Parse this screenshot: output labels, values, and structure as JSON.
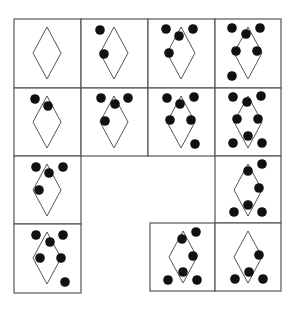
{
  "puzzle": {
    "title": "",
    "stroke_color": "#555555",
    "dot_color": "#111111",
    "dot_radius": 4.8,
    "diamond": {
      "cx": 33,
      "cy": 34,
      "half_width": 14,
      "half_height": 26
    },
    "cells": [
      {
        "id": "r0c0",
        "row": 0,
        "col": 0,
        "x": 14,
        "y": 19,
        "w": 67,
        "h": 69,
        "dots": []
      },
      {
        "id": "r0c1",
        "row": 0,
        "col": 1,
        "x": 81,
        "y": 19,
        "w": 67,
        "h": 69,
        "dots": [
          [
            19,
            11
          ],
          [
            23,
            35
          ]
        ]
      },
      {
        "id": "r0c2",
        "row": 0,
        "col": 2,
        "x": 148,
        "y": 19,
        "w": 67,
        "h": 69,
        "dots": [
          [
            18,
            10
          ],
          [
            45,
            10
          ],
          [
            31,
            17
          ],
          [
            21,
            34
          ]
        ]
      },
      {
        "id": "r0c3",
        "row": 0,
        "col": 3,
        "x": 215,
        "y": 19,
        "w": 66,
        "h": 69,
        "dots": [
          [
            17,
            9
          ],
          [
            45,
            9
          ],
          [
            31,
            15
          ],
          [
            21,
            32
          ],
          [
            42,
            32
          ],
          [
            17,
            57
          ]
        ]
      },
      {
        "id": "r1c0",
        "row": 1,
        "col": 0,
        "x": 14,
        "y": 88,
        "w": 67,
        "h": 68,
        "dots": [
          [
            21,
            11
          ],
          [
            34,
            18
          ]
        ]
      },
      {
        "id": "r1c1",
        "row": 1,
        "col": 1,
        "x": 81,
        "y": 88,
        "w": 67,
        "h": 68,
        "dots": [
          [
            20,
            10
          ],
          [
            47,
            10
          ],
          [
            34,
            16
          ],
          [
            24,
            33
          ]
        ]
      },
      {
        "id": "r1c2",
        "row": 1,
        "col": 2,
        "x": 148,
        "y": 88,
        "w": 67,
        "h": 68,
        "dots": [
          [
            19,
            10
          ],
          [
            46,
            9
          ],
          [
            32,
            16
          ],
          [
            22,
            32
          ],
          [
            43,
            32
          ],
          [
            47,
            56
          ]
        ]
      },
      {
        "id": "r1c3",
        "row": 1,
        "col": 3,
        "x": 215,
        "y": 88,
        "w": 66,
        "h": 68,
        "dots": [
          [
            18,
            9
          ],
          [
            46,
            8
          ],
          [
            32,
            14
          ],
          [
            22,
            31
          ],
          [
            43,
            31
          ],
          [
            33,
            48
          ],
          [
            18,
            55
          ],
          [
            47,
            55
          ]
        ]
      },
      {
        "id": "r2c0",
        "row": 2,
        "col": 0,
        "x": 14,
        "y": 156,
        "w": 67,
        "h": 68,
        "dots": [
          [
            22,
            11
          ],
          [
            49,
            11
          ],
          [
            35,
            17
          ],
          [
            25,
            34
          ]
        ]
      },
      {
        "id": "r2c3",
        "row": 2,
        "col": 3,
        "x": 215,
        "y": 156,
        "w": 66,
        "h": 67,
        "dots": [
          [
            47,
            8
          ],
          [
            33,
            15
          ],
          [
            44,
            32
          ],
          [
            33,
            49
          ],
          [
            19,
            56
          ],
          [
            47,
            56
          ]
        ]
      },
      {
        "id": "r3c0",
        "row": 3,
        "col": 0,
        "x": 14,
        "y": 224,
        "w": 67,
        "h": 69,
        "dots": [
          [
            22,
            11
          ],
          [
            49,
            11
          ],
          [
            36,
            18
          ],
          [
            26,
            34
          ],
          [
            47,
            34
          ],
          [
            51,
            58
          ]
        ]
      },
      {
        "id": "r3c2",
        "row": 3,
        "col": 2,
        "x": 150,
        "y": 223,
        "w": 65,
        "h": 68,
        "dots": [
          [
            46,
            9
          ],
          [
            32,
            16
          ],
          [
            43,
            33
          ],
          [
            33,
            49
          ],
          [
            18,
            57
          ],
          [
            47,
            57
          ]
        ]
      },
      {
        "id": "r3c3",
        "row": 3,
        "col": 3,
        "x": 215,
        "y": 223,
        "w": 66,
        "h": 68,
        "dots": [
          [
            44,
            32
          ],
          [
            34,
            49
          ],
          [
            20,
            56
          ],
          [
            48,
            56
          ]
        ]
      }
    ]
  }
}
